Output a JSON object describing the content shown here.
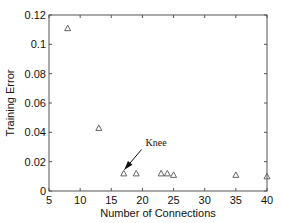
{
  "chart_data": {
    "type": "scatter",
    "title": "",
    "xlabel": "Number of Connections",
    "ylabel": "Training Error",
    "xlim": [
      5,
      40
    ],
    "ylim": [
      0,
      0.12
    ],
    "xticks": [
      5,
      10,
      15,
      20,
      25,
      30,
      35,
      40
    ],
    "xtick_labels": [
      "5",
      "10",
      "15",
      "20",
      "25",
      "30",
      "35",
      "40"
    ],
    "yticks": [
      0,
      0.02,
      0.04,
      0.06,
      0.08,
      0.1,
      0.12
    ],
    "ytick_labels": [
      "0",
      "0.02",
      "0.04",
      "0.06",
      "0.08",
      "0.1",
      "0.12"
    ],
    "grid": false,
    "legend": null,
    "marker": "triangle",
    "series": [
      {
        "name": "Training Error",
        "x": [
          8,
          13,
          17,
          19,
          23,
          24,
          25,
          35,
          40
        ],
        "y": [
          0.111,
          0.043,
          0.012,
          0.012,
          0.012,
          0.012,
          0.011,
          0.011,
          0.01
        ]
      }
    ],
    "annotations": [
      {
        "text": "Knee",
        "text_x": 20.5,
        "text_y": 0.031,
        "arrow_to_x": 17.1,
        "arrow_to_y": 0.0145
      }
    ],
    "colors": {
      "axes": "#555555",
      "marker": "#555555",
      "text": "#111111"
    }
  }
}
